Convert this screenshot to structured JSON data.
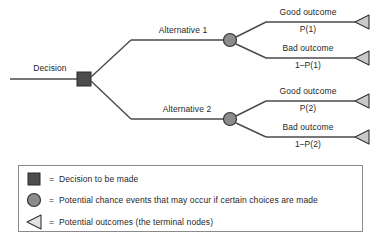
{
  "diagram": {
    "type": "decision-tree",
    "root_label": "Decision",
    "branches": [
      {
        "alternative_label": "Alternative 1",
        "outcomes": [
          {
            "name": "Good outcome",
            "probability": "P(1)"
          },
          {
            "name": "Bad outcome",
            "probability": "1–P(1)"
          }
        ]
      },
      {
        "alternative_label": "Alternative 2",
        "outcomes": [
          {
            "name": "Good outcome",
            "probability": "P(2)"
          },
          {
            "name": "Bad outcome",
            "probability": "1–P(2)"
          }
        ]
      }
    ]
  },
  "legend": {
    "items": [
      {
        "symbol": "square",
        "equals": "=",
        "text": "Decision to be made"
      },
      {
        "symbol": "circle",
        "equals": "=",
        "text": "Potential chance events that may occur if certain choices are made"
      },
      {
        "symbol": "triangle",
        "equals": "=",
        "text": "Potential outcomes (the terminal nodes)"
      }
    ]
  },
  "colors": {
    "line": "#4a4a4a",
    "decision_node_fill": "#4d4d4d",
    "chance_node_fill": "#8c8c8c",
    "terminal_node_fill": "#c9c9c9",
    "node_stroke": "#333333",
    "legend_border": "#8a8a8a",
    "background": "#ffffff",
    "text": "#1f1f1f"
  }
}
